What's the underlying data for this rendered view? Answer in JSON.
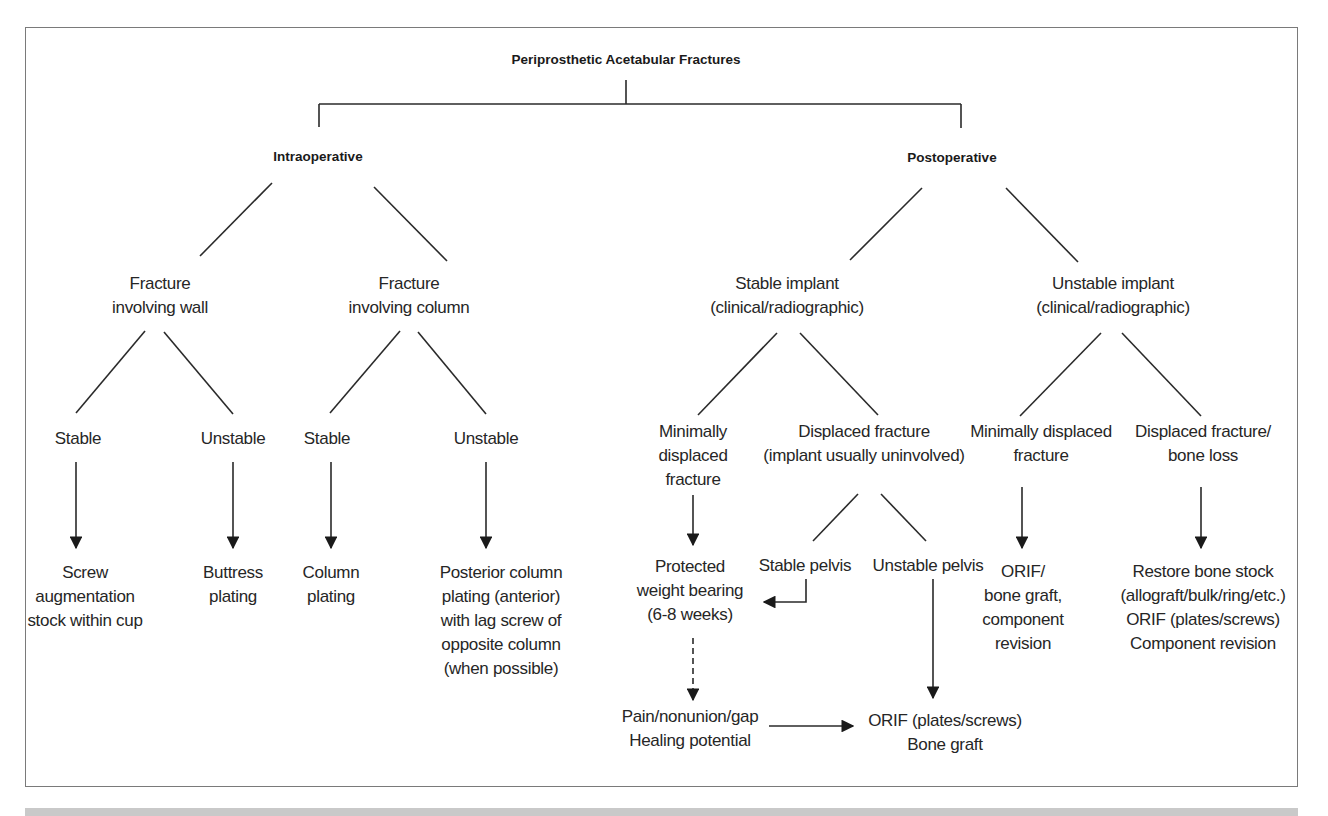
{
  "diagram": {
    "title": "Periprosthetic Acetabular Fractures",
    "branches": {
      "intraoperative": {
        "label": "Intraoperative",
        "wall": {
          "label": "Fracture\ninvolving wall",
          "stable": {
            "label": "Stable",
            "treatment": "Screw\naugmentation\nstock within cup"
          },
          "unstable": {
            "label": "Unstable",
            "treatment": "Buttress\nplating"
          }
        },
        "column": {
          "label": "Fracture\ninvolving column",
          "stable": {
            "label": "Stable",
            "treatment": "Column\nplating"
          },
          "unstable": {
            "label": "Unstable",
            "treatment": "Posterior column\nplating (anterior)\nwith lag screw of\nopposite column\n(when possible)"
          }
        }
      },
      "postoperative": {
        "label": "Postoperative",
        "stable_implant": {
          "label": "Stable implant\n(clinical/radiographic)",
          "minimally_displaced": {
            "label": "Minimally\ndisplaced\nfracture",
            "treatment": "Protected\nweight bearing\n(6-8 weeks)",
            "followup": "Pain/nonunion/gap\nHealing potential"
          },
          "displaced": {
            "label": "Displaced fracture\n(implant usually uninvolved)",
            "stable_pelvis": "Stable pelvis",
            "unstable_pelvis": "Unstable pelvis",
            "orif": "ORIF (plates/screws)\nBone graft"
          }
        },
        "unstable_implant": {
          "label": "Unstable implant\n(clinical/radiographic)",
          "minimally_displaced": {
            "label": "Minimally displaced\nfracture",
            "treatment": "ORIF/\nbone graft,\ncomponent\nrevision"
          },
          "displaced": {
            "label": "Displaced fracture/\nbone loss",
            "treatment": "Restore bone stock\n(allograft/bulk/ring/etc.)\nORIF (plates/screws)\nComponent revision"
          }
        }
      }
    },
    "colors": {
      "line": "#2a2a2a",
      "frame": "#7a7a7a",
      "band": "#c9c9c9",
      "text": "#262626"
    }
  }
}
